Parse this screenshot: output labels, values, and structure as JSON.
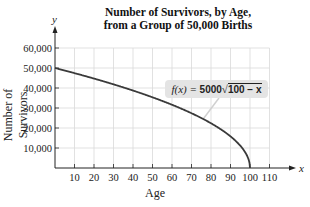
{
  "chart_data": {
    "type": "line",
    "title": "Number of Survivors, by Age, from a Group of 50,000 Births",
    "title_lines": [
      "Number of Survivors, by Age,",
      "from a Group of 50,000 Births"
    ],
    "xlabel": "Age",
    "ylabel": "Number of Survivors",
    "x_axis_var": "x",
    "y_axis_var": "y",
    "xlim": [
      0,
      115
    ],
    "ylim": [
      0,
      65000
    ],
    "x_ticks": [
      10,
      20,
      30,
      40,
      50,
      60,
      70,
      80,
      90,
      100,
      110
    ],
    "x_tick_labels": [
      "10",
      "20",
      "30",
      "40",
      "50",
      "60",
      "70",
      "80",
      "90",
      "100",
      "110"
    ],
    "y_ticks": [
      10000,
      20000,
      30000,
      40000,
      50000,
      60000
    ],
    "y_tick_labels": [
      "10,000",
      "20,000",
      "30,000",
      "40,000",
      "50,000",
      "60,000"
    ],
    "grid": true,
    "series": [
      {
        "name": "f(x) = 5000√(100 − x)",
        "x": [
          0,
          10,
          20,
          30,
          40,
          50,
          60,
          70,
          80,
          90,
          95,
          99,
          100
        ],
        "values": [
          50000,
          47434,
          44721,
          41833,
          38730,
          35355,
          31623,
          27386,
          22361,
          15811,
          11180,
          5000,
          0
        ]
      }
    ],
    "annotations": [
      {
        "text": "f(x) = 5000√(100 − x)",
        "points_to_x": 76
      }
    ],
    "colors": {
      "curve": "#3a3a3a",
      "grid": "#d9d9d9",
      "label_bg": "#e4e4e4"
    }
  },
  "labels": {
    "title_line1": "Number of Survivors, by Age,",
    "title_line2": "from a Group of 50,000 Births",
    "xlabel": "Age",
    "ylabel": "Number of Survivors",
    "x_var": "x",
    "y_var": "y",
    "fx_prefix": "f(x) = ",
    "fx_coef": "5000",
    "fx_radicand": "100 − x"
  }
}
